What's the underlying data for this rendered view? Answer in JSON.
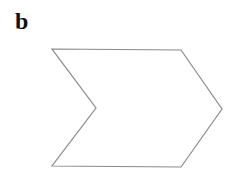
{
  "figure": {
    "panel_label": "b",
    "shape": {
      "type": "chevron",
      "stroke": "#8a8a8a",
      "fill": "#ffffff",
      "points": "52,49 181,50 222,109 181,167 52,166 96,108"
    }
  }
}
